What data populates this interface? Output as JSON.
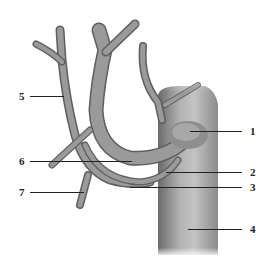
{
  "diagram": {
    "type": "anatomical-vessel-diagram",
    "colors": {
      "vessel_fill": "#8a8a8a",
      "vessel_highlight": "#b5b5b5",
      "vessel_shadow": "#5e5e5e",
      "trunk_fill": "#9a9a9a",
      "label_color": "#222222",
      "background": "#ffffff"
    },
    "labels": {
      "right": [
        {
          "id": "1",
          "text": "1"
        },
        {
          "id": "2",
          "text": "2"
        },
        {
          "id": "3",
          "text": "3"
        },
        {
          "id": "4",
          "text": "4"
        }
      ],
      "left": [
        {
          "id": "5",
          "text": "5"
        },
        {
          "id": "6",
          "text": "6"
        },
        {
          "id": "7",
          "text": "7"
        }
      ]
    }
  }
}
